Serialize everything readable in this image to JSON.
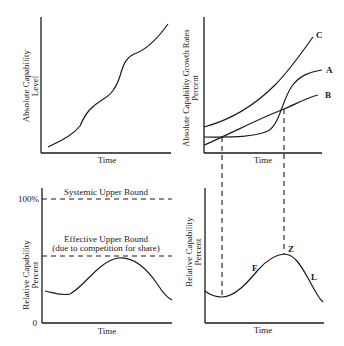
{
  "panels": {
    "top_left": {
      "y_label_line1": "Absolute Capability",
      "y_label_line2": "Level",
      "x_label": "Time"
    },
    "top_right": {
      "y_label_line1": "Absolute Capability Growth Rates",
      "y_label_line2": "Percent",
      "x_label": "Time",
      "curve_labels": {
        "c": "C",
        "a": "A",
        "b": "B"
      }
    },
    "bottom_left": {
      "y_label_line1": "Relative Capability",
      "y_label_line2": "Percent",
      "x_label": "Time",
      "tick_top": "100%",
      "tick_bottom": "0",
      "systemic_bound": "Systemic Upper Bound",
      "effective_bound_line1": "Effective Upper Bound",
      "effective_bound_line2": "(due to competition for share)"
    },
    "bottom_right": {
      "y_label_line1": "Relative Capability",
      "y_label_line2": "Percent",
      "x_label": "Time",
      "point_labels": {
        "f": "F",
        "z": "Z",
        "l": "L"
      }
    }
  }
}
